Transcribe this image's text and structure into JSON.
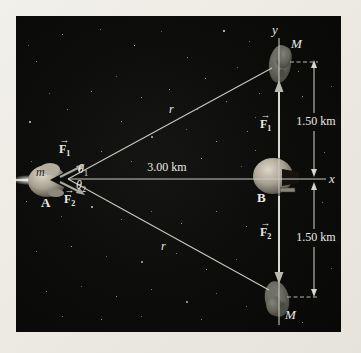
{
  "figure": {
    "caption": "Gravitational forces on spaceship of mass m at A from two asteroids of mass M, with ship B at origin",
    "vec_arrow": "→",
    "labels": {
      "y_axis": "y",
      "x_axis": "x",
      "mass_top": "M",
      "mass_bottom": "M",
      "ship_a": "A",
      "ship_b": "B",
      "mass_small": "m",
      "r_top": "r",
      "r_bottom": "r",
      "dist_ab": "3.00 km",
      "dist_top": "1.50 km",
      "dist_bottom": "1.50 km",
      "theta1": {
        "base": "θ",
        "sub": "1"
      },
      "theta2": {
        "base": "θ",
        "sub": "2"
      },
      "f1_a": {
        "base": "F",
        "sub": "1"
      },
      "f2_a": {
        "base": "F",
        "sub": "2"
      },
      "f1_b": {
        "base": "F",
        "sub": "1"
      },
      "f2_b": {
        "base": "F",
        "sub": "2"
      }
    },
    "colors": {
      "page-bg": "#e9e6df",
      "panel-bg": "#0c0c0a",
      "line": "#c9c9c0",
      "text": "#ece9e2",
      "dim-line": "#d6d6cc",
      "arrow-gray": "#a9a9a0"
    },
    "stars": [
      [
        62,
        34,
        1,
        0.8
      ],
      [
        100,
        29,
        1,
        0.55
      ],
      [
        134,
        45,
        1,
        0.9
      ],
      [
        161,
        31,
        1,
        0.5
      ],
      [
        187,
        57,
        1,
        0.7
      ],
      [
        223,
        30,
        2,
        0.85
      ],
      [
        249,
        41,
        1,
        0.6
      ],
      [
        205,
        78,
        1,
        0.75
      ],
      [
        237,
        67,
        1,
        0.5
      ],
      [
        259,
        93,
        1,
        0.65
      ],
      [
        302,
        96,
        1,
        0.8
      ],
      [
        331,
        86,
        1,
        0.5
      ],
      [
        298,
        71,
        1,
        0.6
      ],
      [
        324,
        152,
        1,
        0.6
      ],
      [
        333,
        118,
        1,
        0.45
      ],
      [
        36,
        61,
        1,
        0.7
      ],
      [
        49,
        93,
        1,
        0.5
      ],
      [
        29,
        121,
        2,
        0.8
      ],
      [
        67,
        109,
        1,
        0.6
      ],
      [
        91,
        91,
        1,
        0.75
      ],
      [
        116,
        76,
        1,
        0.5
      ],
      [
        141,
        97,
        1,
        0.7
      ],
      [
        169,
        89,
        1,
        0.85
      ],
      [
        197,
        109,
        1,
        0.5
      ],
      [
        226,
        101,
        1,
        0.6
      ],
      [
        121,
        121,
        1,
        0.75
      ],
      [
        151,
        136,
        2,
        0.7
      ],
      [
        186,
        129,
        1,
        0.5
      ],
      [
        216,
        141,
        1,
        0.8
      ],
      [
        247,
        131,
        1,
        0.6
      ],
      [
        31,
        161,
        1,
        0.5
      ],
      [
        101,
        151,
        1,
        0.7
      ],
      [
        131,
        161,
        1,
        0.6
      ],
      [
        201,
        158,
        1,
        0.85
      ],
      [
        241,
        166,
        1,
        0.5
      ],
      [
        26,
        201,
        1,
        0.7
      ],
      [
        61,
        216,
        1,
        0.5
      ],
      [
        91,
        206,
        2,
        0.8
      ],
      [
        121,
        219,
        1,
        0.6
      ],
      [
        151,
        211,
        1,
        0.5
      ],
      [
        181,
        223,
        1,
        0.75
      ],
      [
        216,
        211,
        1,
        0.6
      ],
      [
        246,
        226,
        1,
        0.7
      ],
      [
        36,
        251,
        1,
        0.6
      ],
      [
        71,
        246,
        1,
        0.8
      ],
      [
        106,
        256,
        1,
        0.5
      ],
      [
        141,
        261,
        2,
        0.7
      ],
      [
        176,
        253,
        1,
        0.6
      ],
      [
        206,
        269,
        1,
        0.8
      ],
      [
        236,
        259,
        1,
        0.5
      ],
      [
        46,
        291,
        1,
        0.7
      ],
      [
        81,
        286,
        1,
        0.5
      ],
      [
        116,
        296,
        1,
        0.8
      ],
      [
        151,
        289,
        1,
        0.6
      ],
      [
        186,
        301,
        2,
        0.7
      ],
      [
        216,
        293,
        1,
        0.5
      ],
      [
        62,
        316,
        1,
        0.6
      ],
      [
        101,
        319,
        1,
        0.75
      ],
      [
        141,
        316,
        1,
        0.5
      ],
      [
        201,
        319,
        1,
        0.65
      ],
      [
        246,
        306,
        1,
        0.6
      ],
      [
        322,
        202,
        1,
        0.55
      ],
      [
        331,
        268,
        1,
        0.5
      ],
      [
        302,
        322,
        1,
        0.65
      ],
      [
        28,
        45,
        1,
        0.5
      ],
      [
        255,
        150,
        1,
        0.6
      ],
      [
        255,
        117,
        1,
        0.5
      ]
    ]
  }
}
